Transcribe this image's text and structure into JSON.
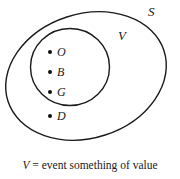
{
  "figure": {
    "type": "venn-diagram",
    "background_color": "#ffffff",
    "stroke_color": "#1a1a1a",
    "sets": [
      {
        "id": "S",
        "label": "S",
        "role": "sample-space",
        "shape": "ellipse-rotated",
        "cx": 86,
        "cy": 76,
        "rx": 82,
        "ry": 62,
        "rotation_deg": -18
      },
      {
        "id": "V",
        "label": "V",
        "role": "event",
        "shape": "circle",
        "cx": 70,
        "cy": 67,
        "rx": 39,
        "ry": 39,
        "rotation_deg": 0
      }
    ],
    "points": [
      {
        "label": "O",
        "inside": [
          "S",
          "V"
        ]
      },
      {
        "label": "B",
        "inside": [
          "S",
          "V"
        ]
      },
      {
        "label": "G",
        "inside": [
          "S",
          "V"
        ]
      },
      {
        "label": "D",
        "inside": [
          "S"
        ]
      }
    ],
    "caption": {
      "variable": "V",
      "equals": "=",
      "description": "event something of value",
      "full_text": "V = event something of value"
    }
  }
}
